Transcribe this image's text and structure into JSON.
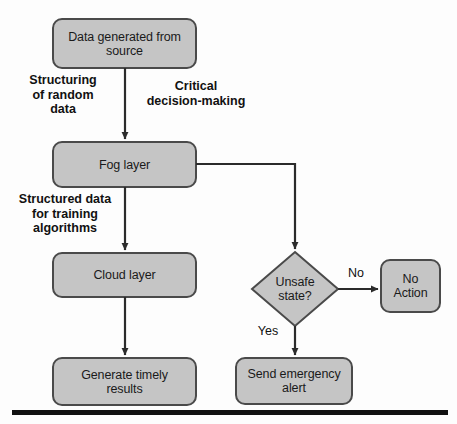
{
  "diagram": {
    "style": {
      "node_fill": "#c5c5c5",
      "node_stroke": "#4a4a4a",
      "edge_color": "#2b2b2b",
      "text_color": "#1a1a1a",
      "background": "#fdfdfd",
      "rule_color": "#111111"
    },
    "nodes": [
      {
        "id": "data-source",
        "shape": "rounded-rect",
        "label": "Data generated from\nsource",
        "x": 53,
        "y": 19,
        "w": 143,
        "h": 49
      },
      {
        "id": "fog-layer",
        "shape": "rounded-rect",
        "label": "Fog layer",
        "x": 53,
        "y": 142,
        "w": 143,
        "h": 45
      },
      {
        "id": "cloud-layer",
        "shape": "rounded-rect",
        "label": "Cloud layer",
        "x": 53,
        "y": 253,
        "w": 143,
        "h": 44
      },
      {
        "id": "generate-results",
        "shape": "rounded-rect",
        "label": "Generate timely\nresults",
        "x": 53,
        "y": 358,
        "w": 143,
        "h": 47
      },
      {
        "id": "unsafe-state",
        "shape": "diamond",
        "label": "Unsafe\nstate?",
        "cx": 295,
        "cy": 289,
        "rx": 43,
        "ry": 37
      },
      {
        "id": "no-action",
        "shape": "rounded-rect",
        "label": "No\nAction",
        "x": 381,
        "y": 260,
        "w": 59,
        "h": 52
      },
      {
        "id": "send-alert",
        "shape": "rounded-rect",
        "label": "Send emergency\nalert",
        "x": 236,
        "y": 358,
        "w": 116,
        "h": 46
      }
    ],
    "edges": [
      {
        "id": "source-to-fog",
        "from": "data-source",
        "to": "fog-layer",
        "label": "Structuring\nof random\ndata",
        "label_x": 18,
        "label_y": 73,
        "label_w": 90
      },
      {
        "id": "fog-to-unsafe",
        "from": "fog-layer",
        "to": "unsafe-state",
        "label": "Critical\ndecision-making",
        "label_x": 136,
        "label_y": 79,
        "label_w": 120
      },
      {
        "id": "fog-to-cloud",
        "from": "fog-layer",
        "to": "cloud-layer",
        "label": "Structured data\nfor training\nalgorithms",
        "label_x": 6,
        "label_y": 192,
        "label_w": 118
      },
      {
        "id": "cloud-to-results",
        "from": "cloud-layer",
        "to": "generate-results",
        "label": "",
        "label_x": 0,
        "label_y": 0,
        "label_w": 0
      },
      {
        "id": "unsafe-to-no-action",
        "from": "unsafe-state",
        "to": "no-action",
        "label": "No",
        "label_x": 342,
        "label_y": 266,
        "label_w": 28
      },
      {
        "id": "unsafe-to-alert",
        "from": "unsafe-state",
        "to": "send-alert",
        "label": "Yes",
        "label_x": 252,
        "label_y": 324,
        "label_w": 32
      }
    ],
    "footer_rule": {
      "x": 12,
      "y": 410,
      "w": 436,
      "h": 5
    }
  }
}
